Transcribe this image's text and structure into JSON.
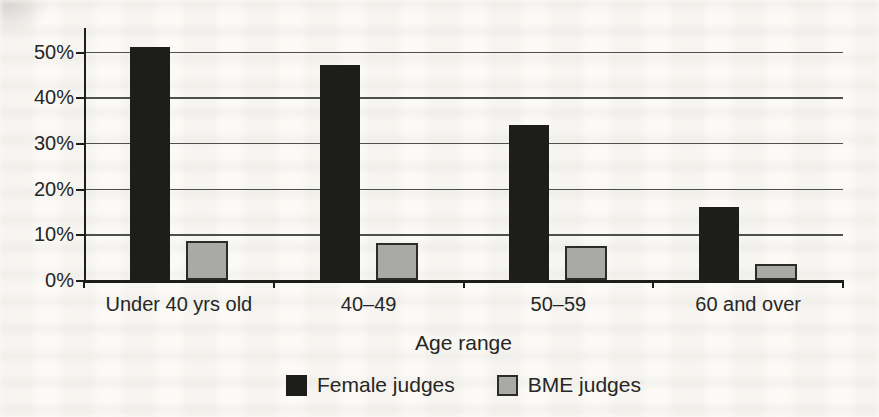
{
  "figure": {
    "description_role": "scanned-book-figure",
    "paper_color": "#fbfaf6"
  },
  "chart_data": {
    "type": "bar",
    "categories": [
      "Under 40 yrs old",
      "40–49",
      "50–59",
      "60 and over"
    ],
    "series": [
      {
        "name": "Female judges",
        "color": "#1d1d1b",
        "border": "",
        "values": [
          51,
          47,
          34,
          16
        ]
      },
      {
        "name": "BME judges",
        "color": "#a9a9a5",
        "border": "#2b2b29",
        "values": [
          8.5,
          8,
          7.5,
          3.5
        ]
      }
    ],
    "title": "",
    "xlabel": "Age range",
    "ylabel": "",
    "ylim": [
      0,
      55
    ],
    "yticks": [
      0,
      10,
      20,
      30,
      40,
      50
    ],
    "ytick_suffix": "%",
    "grid": "horizontal",
    "legend_position": "bottom",
    "axis_color": "#1d1d1b",
    "gridline_color": "#4f4f4d",
    "text_color": "#262624"
  }
}
